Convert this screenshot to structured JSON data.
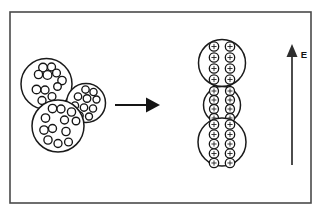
{
  "figure": {
    "background_color": "#ffffff",
    "frame": {
      "name": "outer-border",
      "stroke_color": "#4a4a4a",
      "x": 10,
      "y": 12,
      "width": 301,
      "height": 191
    }
  },
  "left_group": {
    "label": "uncharged-droplet-cluster",
    "description": "Three overlapping droplets filled with randomly scattered internal particles",
    "droplets": [
      {
        "name": "droplet-upper-left",
        "cx": 46.5,
        "cy": 84.0,
        "r": 25.5,
        "particles": [
          {
            "cx": 43.0,
            "cy": 67.5,
            "r": 4.3
          },
          {
            "cx": 51.5,
            "cy": 67.0,
            "r": 4.0
          },
          {
            "cx": 38.5,
            "cy": 74.5,
            "r": 4.1
          },
          {
            "cx": 47.5,
            "cy": 75.0,
            "r": 4.4
          },
          {
            "cx": 56.5,
            "cy": 73.0,
            "r": 3.9
          },
          {
            "cx": 62.0,
            "cy": 80.5,
            "r": 4.2
          },
          {
            "cx": 36.5,
            "cy": 89.5,
            "r": 4.3
          },
          {
            "cx": 45.0,
            "cy": 90.0,
            "r": 4.0
          },
          {
            "cx": 57.5,
            "cy": 86.5,
            "r": 3.8
          },
          {
            "cx": 52.0,
            "cy": 96.5,
            "r": 3.9
          },
          {
            "cx": 42.0,
            "cy": 100.5,
            "r": 4.0
          }
        ]
      },
      {
        "name": "droplet-right",
        "cx": 86.0,
        "cy": 103.0,
        "r": 19.5,
        "particles": [
          {
            "cx": 85.5,
            "cy": 89.5,
            "r": 3.7
          },
          {
            "cx": 93.5,
            "cy": 92.0,
            "r": 3.6
          },
          {
            "cx": 78.0,
            "cy": 96.5,
            "r": 3.7
          },
          {
            "cx": 87.0,
            "cy": 98.5,
            "r": 3.8
          },
          {
            "cx": 96.5,
            "cy": 99.5,
            "r": 3.5
          },
          {
            "cx": 75.0,
            "cy": 105.5,
            "r": 3.6
          },
          {
            "cx": 84.0,
            "cy": 107.5,
            "r": 3.7
          },
          {
            "cx": 93.0,
            "cy": 108.5,
            "r": 3.6
          },
          {
            "cx": 79.5,
            "cy": 115.5,
            "r": 3.7
          },
          {
            "cx": 89.0,
            "cy": 116.5,
            "r": 3.5
          }
        ]
      },
      {
        "name": "droplet-lower-left",
        "cx": 58.0,
        "cy": 126.0,
        "r": 26.0,
        "particles": [
          {
            "cx": 52.5,
            "cy": 108.5,
            "r": 4.2
          },
          {
            "cx": 61.0,
            "cy": 109.0,
            "r": 4.0
          },
          {
            "cx": 71.5,
            "cy": 112.0,
            "r": 4.1
          },
          {
            "cx": 45.5,
            "cy": 118.0,
            "r": 4.2
          },
          {
            "cx": 64.5,
            "cy": 120.0,
            "r": 4.0
          },
          {
            "cx": 76.0,
            "cy": 121.0,
            "r": 3.8
          },
          {
            "cx": 44.0,
            "cy": 130.0,
            "r": 4.2
          },
          {
            "cx": 52.5,
            "cy": 128.5,
            "r": 4.0
          },
          {
            "cx": 66.0,
            "cy": 131.5,
            "r": 4.1
          },
          {
            "cx": 48.0,
            "cy": 140.0,
            "r": 4.1
          },
          {
            "cx": 58.0,
            "cy": 143.5,
            "r": 4.0
          },
          {
            "cx": 68.5,
            "cy": 142.0,
            "r": 3.9
          }
        ]
      }
    ]
  },
  "transition_arrow": {
    "name": "transformation-arrow",
    "direction": "right",
    "x_start": 115,
    "x_end": 158,
    "y": 105
  },
  "right_group": {
    "label": "charged-droplet-chain",
    "description": "Three vertically stacked droplets whose internal particles align into two ordered columns; each particle carries a plus charge",
    "charge_symbol": "+",
    "droplets": [
      {
        "name": "chain-droplet-top",
        "cx": 222.0,
        "cy": 63.0,
        "r": 23.5,
        "rows": 4,
        "columns": 2,
        "particle_count": 8,
        "column_x": [
          214.0,
          230.0
        ],
        "row_y": [
          46.5,
          57.5,
          68.5,
          79.5
        ],
        "particle_r": 4.7
      },
      {
        "name": "chain-droplet-middle",
        "cx": 222.0,
        "cy": 105.0,
        "r": 18.5,
        "rows": 4,
        "columns": 2,
        "particle_count": 8,
        "column_x": [
          214.0,
          230.0
        ],
        "row_y": [
          91.0,
          100.0,
          109.0,
          118.0
        ],
        "particle_r": 4.5
      },
      {
        "name": "chain-droplet-bottom",
        "cx": 222.0,
        "cy": 142.0,
        "r": 24.0,
        "rows": 5,
        "columns": 2,
        "particle_count": 10,
        "column_x": [
          214.0,
          230.0
        ],
        "row_y": [
          124.5,
          134.5,
          144.0,
          153.5,
          163.0
        ],
        "particle_r": 4.7
      }
    ]
  },
  "field_indicator": {
    "name": "electric-field-arrow",
    "label": "E",
    "direction": "up",
    "x": 292.0,
    "y_tail": 165.0,
    "y_head": 47.0,
    "label_x": 304.0,
    "label_y": 58.0
  }
}
